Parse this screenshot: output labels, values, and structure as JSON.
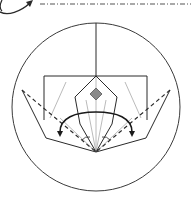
{
  "diagram": {
    "type": "origami-fold-diagram",
    "description": "Origami folding step with squash-fold arrows inside circular detail view",
    "colors": {
      "line": "#2a2a2a",
      "crease": "#9a9a9a",
      "diamond_fill": "#8a8a8a",
      "background": "#ffffff"
    },
    "elements": {
      "top_arrow": "curved-fold-arrow",
      "top_dashdot": "mountain-fold-line",
      "circle": "detail-view-circle",
      "paper": "folded-paper-outline",
      "kite": "center-kite-flap",
      "diamond": "reference-diamond-mark",
      "left_dashed": "valley-fold-line-left",
      "right_dashed": "valley-fold-line-right",
      "left_arrow": "squash-arrow-left",
      "right_arrow": "squash-arrow-right"
    },
    "labels": {
      "top_arrow": "Curved fold arrow",
      "top_dashdot": "Mountain fold line",
      "circle": "Detail view",
      "left_arrow": "Squash fold left",
      "right_arrow": "Squash fold right"
    }
  }
}
